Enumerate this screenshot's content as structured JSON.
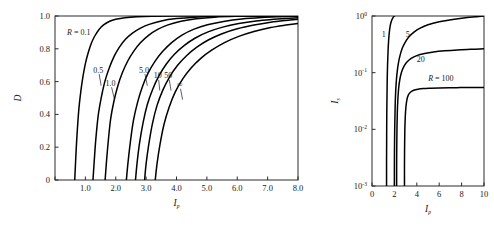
{
  "figure": {
    "background": "#ffffff",
    "curve_color": "#000000",
    "axis_color": "#2b2b2b"
  },
  "chart_data": [
    {
      "id": "left-panel",
      "type": "line",
      "title": "",
      "xlabel": "I_p",
      "ylabel": "D",
      "xlabel_main": "I",
      "xlabel_sub": "p",
      "ylabel_main": "D",
      "xscale": "linear",
      "yscale": "linear",
      "xlim": [
        0.0,
        8.0
      ],
      "ylim": [
        0.0,
        1.0
      ],
      "grid": false,
      "legend": "inline-curve-labels",
      "xticks": [
        0,
        1.0,
        2.0,
        3.0,
        4.0,
        5.0,
        6.0,
        7.0,
        8.0
      ],
      "xticklabels": [
        "",
        "1.0",
        "2.0",
        "3.0",
        "4.0",
        "5.0",
        "6.0",
        "7.0",
        "8.0"
      ],
      "yticks": [
        0,
        0.2,
        0.4,
        0.6,
        0.8,
        1.0
      ],
      "yticklabels": [
        "0",
        "0.2",
        "0.4",
        "0.6",
        "0.8",
        "1.0"
      ],
      "series": [
        {
          "name": "R = 0.1",
          "label": "R = 0.1",
          "label_prefix": "R",
          "label_eq": " = ",
          "label_value": "0.1",
          "label_x": 0.78,
          "label_y": 0.885,
          "has_pointer": false,
          "x": [
            0.65,
            0.68,
            0.72,
            0.78,
            0.85,
            0.92,
            1.0,
            1.1,
            1.2,
            1.3,
            1.45,
            1.6,
            1.8,
            2.0,
            2.3,
            2.7,
            3.2,
            4.0,
            5.0,
            6.0,
            7.0,
            8.0
          ],
          "y": [
            0.0,
            0.12,
            0.26,
            0.42,
            0.54,
            0.63,
            0.71,
            0.78,
            0.835,
            0.875,
            0.918,
            0.946,
            0.968,
            0.98,
            0.99,
            0.996,
            0.999,
            1.0,
            1.0,
            1.0,
            1.0,
            1.0
          ]
        },
        {
          "name": "0.5",
          "label": "0.5",
          "label_value": "0.5",
          "label_x": 1.42,
          "label_y": 0.655,
          "has_pointer": true,
          "pointer_to_x": 1.52,
          "pointer_to_y": 0.575,
          "x": [
            1.25,
            1.29,
            1.34,
            1.42,
            1.52,
            1.64,
            1.78,
            1.95,
            2.12,
            2.32,
            2.55,
            2.8,
            3.1,
            3.5,
            4.0,
            4.6,
            5.3,
            6.1,
            7.0,
            8.0
          ],
          "y": [
            0.0,
            0.11,
            0.24,
            0.39,
            0.5,
            0.6,
            0.68,
            0.755,
            0.81,
            0.858,
            0.896,
            0.925,
            0.949,
            0.97,
            0.984,
            0.993,
            0.998,
            1.0,
            1.0,
            1.0
          ]
        },
        {
          "name": "1.0",
          "label": "1.0",
          "label_value": "1.0",
          "label_x": 1.83,
          "label_y": 0.575,
          "has_pointer": true,
          "pointer_to_x": 1.96,
          "pointer_to_y": 0.49,
          "x": [
            1.65,
            1.69,
            1.75,
            1.83,
            1.94,
            2.07,
            2.22,
            2.4,
            2.6,
            2.82,
            3.08,
            3.38,
            3.72,
            4.15,
            4.65,
            5.25,
            5.95,
            6.8,
            7.5,
            8.0
          ],
          "y": [
            0.0,
            0.1,
            0.23,
            0.37,
            0.48,
            0.575,
            0.655,
            0.727,
            0.787,
            0.838,
            0.882,
            0.918,
            0.946,
            0.968,
            0.983,
            0.993,
            0.998,
            1.0,
            1.0,
            1.0
          ]
        },
        {
          "name": "5.0",
          "label": "5.0",
          "label_value": "5.0",
          "label_x": 2.93,
          "label_y": 0.655,
          "has_pointer": true,
          "pointer_to_x": 3.04,
          "pointer_to_y": 0.575,
          "x": [
            2.35,
            2.4,
            2.48,
            2.58,
            2.72,
            2.88,
            3.06,
            3.28,
            3.54,
            3.84,
            4.18,
            4.58,
            5.02,
            5.55,
            6.15,
            6.8,
            7.4,
            8.0
          ],
          "y": [
            0.0,
            0.1,
            0.23,
            0.36,
            0.475,
            0.57,
            0.65,
            0.72,
            0.783,
            0.838,
            0.884,
            0.92,
            0.947,
            0.967,
            0.982,
            0.991,
            0.996,
            1.0
          ]
        },
        {
          "name": "10",
          "label": "10",
          "label_value": "10",
          "label_x": 3.38,
          "label_y": 0.62,
          "has_pointer": true,
          "pointer_to_x": 3.45,
          "pointer_to_y": 0.545,
          "x": [
            2.65,
            2.7,
            2.78,
            2.9,
            3.04,
            3.22,
            3.42,
            3.66,
            3.94,
            4.26,
            4.62,
            5.04,
            5.52,
            6.05,
            6.62,
            7.2,
            7.6,
            8.0
          ],
          "y": [
            0.0,
            0.1,
            0.22,
            0.35,
            0.46,
            0.555,
            0.635,
            0.706,
            0.768,
            0.821,
            0.866,
            0.903,
            0.932,
            0.954,
            0.97,
            0.98,
            0.985,
            0.99
          ]
        },
        {
          "name": "50",
          "label": "50",
          "label_value": "50",
          "label_x": 3.73,
          "label_y": 0.62,
          "has_pointer": true,
          "pointer_to_x": 3.82,
          "pointer_to_y": 0.545,
          "x": [
            2.95,
            3.0,
            3.09,
            3.21,
            3.36,
            3.55,
            3.77,
            4.03,
            4.33,
            4.67,
            5.06,
            5.5,
            6.0,
            6.55,
            7.1,
            7.6,
            8.0
          ],
          "y": [
            0.0,
            0.1,
            0.22,
            0.345,
            0.455,
            0.548,
            0.628,
            0.698,
            0.758,
            0.81,
            0.855,
            0.892,
            0.922,
            0.945,
            0.962,
            0.973,
            0.98
          ]
        },
        {
          "name": "infinity",
          "label": "∞",
          "label_value": "∞",
          "label_x": 4.1,
          "label_y": 0.565,
          "has_pointer": true,
          "pointer_to_x": 4.2,
          "pointer_to_y": 0.49,
          "x": [
            3.3,
            3.36,
            3.46,
            3.59,
            3.76,
            3.96,
            4.2,
            4.48,
            4.8,
            5.17,
            5.58,
            6.05,
            6.55,
            7.1,
            7.6,
            8.0
          ],
          "y": [
            0.0,
            0.1,
            0.22,
            0.34,
            0.445,
            0.537,
            0.615,
            0.683,
            0.742,
            0.793,
            0.838,
            0.876,
            0.906,
            0.93,
            0.945,
            0.955
          ]
        }
      ]
    },
    {
      "id": "right-panel",
      "type": "line",
      "title": "",
      "xlabel": "I_p",
      "ylabel": "I_s",
      "xlabel_main": "I",
      "xlabel_sub": "p",
      "ylabel_main": "I",
      "ylabel_sub": "s",
      "xscale": "linear",
      "yscale": "log",
      "xlim": [
        0,
        10
      ],
      "ylim": [
        0.001,
        1.0
      ],
      "grid": false,
      "legend": "inline-curve-labels",
      "xticks": [
        0,
        2,
        4,
        6,
        8,
        10
      ],
      "xticklabels": [
        "0",
        "2",
        "4",
        "6",
        "8",
        "10"
      ],
      "yticks": [
        0.001,
        0.01,
        0.1,
        1.0
      ],
      "yticklabels": [
        "10^-3",
        "10^-2",
        "10^-1",
        "10^0"
      ],
      "ytickbase": "10",
      "ytickexponents": [
        "-3",
        "-2",
        "-1",
        "0"
      ],
      "series": [
        {
          "name": "1",
          "label": "1",
          "label_value": "1",
          "label_x": 1.05,
          "label_y": 0.42,
          "has_pointer": false,
          "x": [
            1.3,
            1.3,
            1.31,
            1.32,
            1.34,
            1.36,
            1.39,
            1.43,
            1.48,
            1.54,
            1.62,
            1.72,
            1.85,
            2.0
          ],
          "y": [
            0.001,
            0.003,
            0.008,
            0.018,
            0.04,
            0.08,
            0.14,
            0.23,
            0.36,
            0.5,
            0.66,
            0.8,
            0.92,
            1.0
          ]
        },
        {
          "name": "5",
          "label": "5",
          "label_value": "5",
          "label_x": 3.2,
          "label_y": 0.42,
          "has_pointer": false,
          "x": [
            2.0,
            2.0,
            2.01,
            2.03,
            2.06,
            2.1,
            2.16,
            2.24,
            2.35,
            2.5,
            2.7,
            2.95,
            3.3,
            3.75,
            4.3,
            5.0,
            6.0,
            7.2,
            8.5,
            10.0
          ],
          "y": [
            0.001,
            0.0022,
            0.005,
            0.011,
            0.022,
            0.04,
            0.066,
            0.1,
            0.145,
            0.2,
            0.27,
            0.34,
            0.43,
            0.52,
            0.61,
            0.7,
            0.79,
            0.87,
            0.94,
            1.0
          ]
        },
        {
          "name": "20",
          "label": "20",
          "label_value": "20",
          "label_x": 4.35,
          "label_y": 0.155,
          "has_pointer": false,
          "x": [
            2.2,
            2.2,
            2.21,
            2.23,
            2.26,
            2.31,
            2.38,
            2.48,
            2.62,
            2.82,
            3.1,
            3.5,
            4.0,
            4.7,
            5.5,
            6.5,
            7.6,
            8.8,
            10.0
          ],
          "y": [
            0.001,
            0.0022,
            0.005,
            0.0105,
            0.02,
            0.034,
            0.053,
            0.075,
            0.1,
            0.125,
            0.152,
            0.178,
            0.2,
            0.218,
            0.232,
            0.243,
            0.252,
            0.258,
            0.263
          ]
        },
        {
          "name": "R = 100",
          "label": "R = 100",
          "label_prefix": "R",
          "label_eq": " = ",
          "label_value": "100",
          "label_x": 6.15,
          "label_y": 0.072,
          "has_pointer": false,
          "x": [
            2.9,
            2.9,
            2.91,
            2.93,
            2.97,
            3.03,
            3.12,
            3.25,
            3.45,
            3.72,
            4.1,
            4.6,
            5.25,
            6.0,
            6.9,
            7.9,
            8.9,
            10.0
          ],
          "y": [
            0.001,
            0.0022,
            0.0048,
            0.0095,
            0.0165,
            0.025,
            0.0335,
            0.0405,
            0.0455,
            0.049,
            0.0512,
            0.0525,
            0.0532,
            0.0538,
            0.0542,
            0.0545,
            0.0547,
            0.0549
          ]
        }
      ]
    }
  ]
}
